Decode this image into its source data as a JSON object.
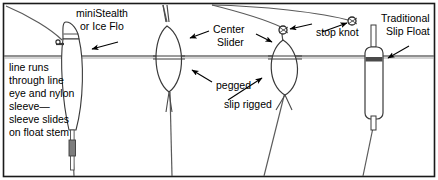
{
  "figure": {
    "kind": "fishing-float-rigging-diagram",
    "frame": {
      "border_color": "#1a1a1a",
      "background_color": "#ffffff"
    },
    "waterline": {
      "label": "waterline",
      "y": 56,
      "color": "#6b6b6b"
    },
    "line_color": "#5a5a5a",
    "float_outline_color": "#3a3a3a",
    "sleeve_color": "#7d7d7d"
  },
  "labels": {
    "ministealth": {
      "line1": "miniStealth",
      "line2": "or Ice Flo"
    },
    "left_note": {
      "line1": "line runs",
      "line2": "through line",
      "line3": "eye and nylon",
      "line4": "sleeve—",
      "line5": "sleeve slides",
      "line6": "on float stem"
    },
    "center_slider": {
      "line1": "Center",
      "line2": "Slider"
    },
    "pegged": "pegged",
    "slip_rigged": "slip rigged",
    "stop_knot": "stop knot",
    "traditional_slip_float": {
      "line1": "Traditional",
      "line2": "Slip Float"
    }
  },
  "floats": [
    {
      "id": "float-ministealth",
      "name": "miniStealth or Ice Flo",
      "style": "teardrop-stem",
      "rigging": "line eye and nylon sleeve, sleeve slides on float stem"
    },
    {
      "id": "float-center-slider-pegged",
      "name": "Center Slider",
      "style": "oval-lens",
      "rigging": "pegged"
    },
    {
      "id": "float-center-slider-slip",
      "name": "Center Slider",
      "style": "oval-lens",
      "rigging": "slip rigged"
    },
    {
      "id": "float-traditional-slip",
      "name": "Traditional Slip Float",
      "style": "cylinder",
      "rigging": "slip rigged with stop knot"
    }
  ],
  "stop_knots": [
    {
      "id": "stop-knot-left",
      "attached_to": "float-center-slider-slip"
    },
    {
      "id": "stop-knot-right",
      "attached_to": "float-traditional-slip"
    }
  ]
}
